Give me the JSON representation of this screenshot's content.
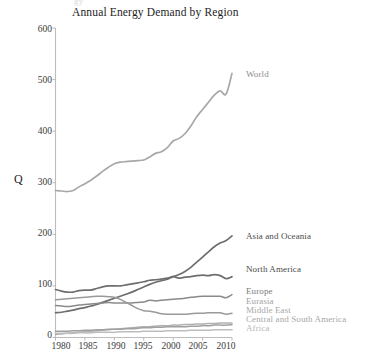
{
  "figure": {
    "ghost_text": "gy",
    "title": "Annual Energy Demand by Region"
  },
  "axes": {
    "ylabel": "Q",
    "yticks": [
      "600",
      "500",
      "400",
      "300",
      "200",
      "100",
      "0"
    ],
    "xticks": [
      "1980",
      "1985",
      "1990",
      "1995",
      "2000",
      "2005",
      "2010"
    ]
  },
  "labels": {
    "world": "World",
    "asia": "Asia and Oceania",
    "north_america": "North America",
    "europe": "Europe",
    "eurasia": "Eurasia",
    "middle_east": "Middle East",
    "central_south_america": "Central and South America",
    "africa": "Africa"
  },
  "colors": {
    "world": "#a8a8a8",
    "asia": "#6e6e6e",
    "north_america": "#6e6e6e",
    "europe": "#8a8a8a",
    "eurasia": "#9a9a9a",
    "middle_east": "#b0b0b0",
    "central_south_america": "#a0a0a0",
    "africa": "#bdbdbd",
    "axis": "#b8b8b8",
    "text": "#1d1d1d"
  },
  "chart_data": {
    "type": "line",
    "title": "Annual Energy Demand by Region",
    "xlabel": "",
    "ylabel": "Q",
    "xlim": [
      1980,
      2010
    ],
    "ylim": [
      0,
      600
    ],
    "grid": false,
    "legend": "inline-right-of-line-ends",
    "x": [
      1980,
      1981,
      1982,
      1983,
      1984,
      1985,
      1986,
      1987,
      1988,
      1989,
      1990,
      1991,
      1992,
      1993,
      1994,
      1995,
      1996,
      1997,
      1998,
      1999,
      2000,
      2001,
      2002,
      2003,
      2004,
      2005,
      2006,
      2007,
      2008,
      2009,
      2010
    ],
    "series": [
      {
        "name": "World",
        "values": [
          285,
          284,
          283,
          285,
          292,
          298,
          305,
          313,
          322,
          330,
          337,
          340,
          341,
          342,
          343,
          344,
          350,
          357,
          360,
          368,
          381,
          386,
          395,
          410,
          428,
          442,
          456,
          470,
          478,
          472,
          512
        ]
      },
      {
        "name": "Asia and Oceania",
        "values": [
          48,
          49,
          51,
          53,
          56,
          58,
          61,
          64,
          68,
          72,
          76,
          80,
          84,
          88,
          93,
          98,
          103,
          107,
          110,
          113,
          118,
          122,
          128,
          136,
          146,
          156,
          166,
          176,
          183,
          188,
          197
        ]
      },
      {
        "name": "North America",
        "values": [
          93,
          90,
          88,
          88,
          91,
          92,
          92,
          95,
          98,
          100,
          100,
          100,
          102,
          104,
          106,
          108,
          111,
          112,
          113,
          115,
          118,
          115,
          117,
          118,
          120,
          121,
          120,
          122,
          120,
          114,
          118
        ]
      },
      {
        "name": "Europe",
        "values": [
          62,
          61,
          60,
          61,
          63,
          64,
          65,
          66,
          67,
          68,
          67,
          67,
          67,
          67,
          68,
          69,
          72,
          71,
          72,
          73,
          74,
          75,
          76,
          78,
          79,
          80,
          80,
          80,
          80,
          77,
          83
        ]
      },
      {
        "name": "Eurasia",
        "values": [
          73,
          74,
          75,
          76,
          77,
          78,
          79,
          80,
          80,
          79,
          78,
          74,
          68,
          62,
          56,
          52,
          51,
          49,
          46,
          45,
          45,
          45,
          45,
          46,
          47,
          47,
          48,
          48,
          48,
          45,
          47
        ]
      },
      {
        "name": "Middle East",
        "values": [
          6,
          7,
          8,
          9,
          10,
          11,
          12,
          13,
          14,
          15,
          16,
          17,
          18,
          19,
          20,
          21,
          21,
          22,
          23,
          23,
          24,
          24,
          25,
          25,
          26,
          26,
          27,
          27,
          28,
          28,
          28
        ]
      },
      {
        "name": "Central and South America",
        "values": [
          12,
          12,
          12,
          13,
          13,
          14,
          14,
          15,
          15,
          16,
          16,
          16,
          17,
          17,
          18,
          19,
          19,
          20,
          20,
          21,
          21,
          21,
          21,
          22,
          22,
          23,
          23,
          24,
          24,
          24,
          25
        ]
      },
      {
        "name": "Africa",
        "values": [
          8,
          8,
          8,
          8,
          9,
          9,
          9,
          10,
          10,
          10,
          10,
          11,
          11,
          11,
          11,
          12,
          12,
          12,
          12,
          13,
          13,
          13,
          13,
          14,
          14,
          14,
          14,
          15,
          15,
          15,
          15
        ]
      }
    ]
  }
}
